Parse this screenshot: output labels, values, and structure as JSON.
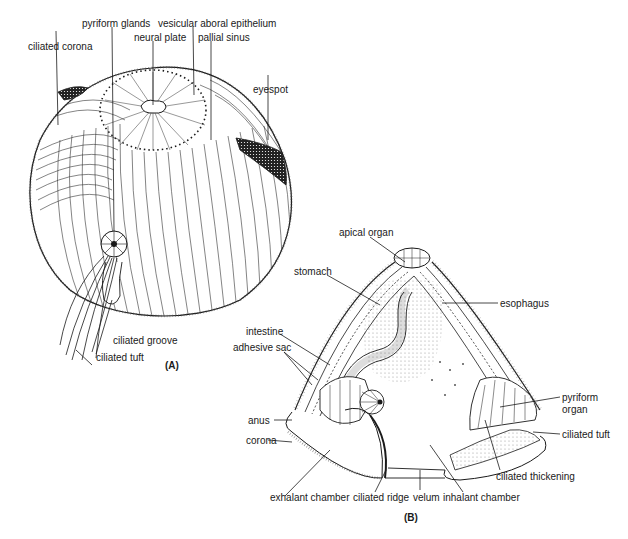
{
  "figure_a": {
    "caption": "(A)",
    "labels": {
      "ciliated_corona": "ciliated corona",
      "pyriform_glands": "pyriform glands",
      "neural_plate": "neural plate",
      "vesicular_aboral_epithelium": "vesicular aboral epithelium",
      "pallial_sinus": "pallial sinus",
      "eyespot": "eyespot",
      "ciliated_groove": "ciliated groove",
      "ciliated_tuft": "ciliated tuft"
    }
  },
  "figure_b": {
    "caption": "(B)",
    "labels": {
      "apical_organ": "apical organ",
      "stomach": "stomach",
      "esophagus": "esophagus",
      "intestine": "intestine",
      "adhesive_sac": "adhesive sac",
      "anus": "anus",
      "corona": "corona",
      "pyriform_organ_line1": "pyriform",
      "pyriform_organ_line2": "organ",
      "ciliated_tuft": "ciliated tuft",
      "ciliated_thickening": "ciliated thickening",
      "exhalant_chamber": "exhalant chamber",
      "ciliated_ridge": "ciliated ridge",
      "velum": "velum",
      "inhalant_chamber": "inhalant chamber"
    }
  },
  "colors": {
    "ink": "#1a1a1a",
    "background": "#ffffff",
    "stipple": "#bdbdbd"
  }
}
